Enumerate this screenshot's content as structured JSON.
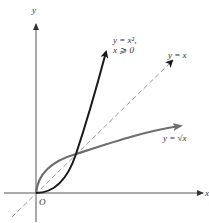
{
  "diagram": {
    "axes": {
      "x_label": "x",
      "y_label": "y",
      "origin_label": "O"
    },
    "curves": [
      {
        "name": "parabola",
        "label_line1": "y = x²,",
        "label_line2": "x ⩾ 0",
        "color": "#1a1a1a"
      },
      {
        "name": "identity",
        "label": "y = x",
        "style": "dashed",
        "color": "#888888"
      },
      {
        "name": "square-root",
        "label": "y = √x",
        "color": "#6e6e6e"
      }
    ],
    "intersection_points": [
      "(0,0)",
      "(1,1)"
    ]
  }
}
